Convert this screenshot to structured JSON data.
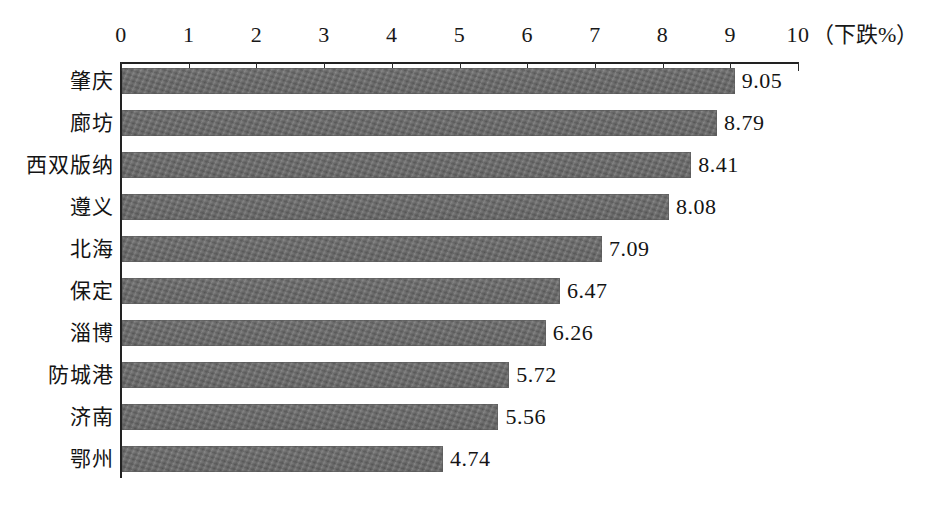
{
  "chart_data": {
    "type": "bar",
    "orientation": "horizontal",
    "title": "",
    "subtitle": "",
    "xlabel": "（下跌%）",
    "ylabel": "",
    "xlim": [
      0,
      10
    ],
    "xticks": [
      "0",
      "1",
      "2",
      "3",
      "4",
      "5",
      "6",
      "7",
      "8",
      "9",
      "10"
    ],
    "grid": false,
    "legend": null,
    "categories": [
      "肇庆",
      "廊坊",
      "西双版纳",
      "遵义",
      "北海",
      "保定",
      "淄博",
      "防城港",
      "济南",
      "鄂州"
    ],
    "values": [
      9.05,
      8.79,
      8.41,
      8.08,
      7.09,
      6.47,
      6.26,
      5.72,
      5.56,
      4.74
    ],
    "value_labels": [
      "9.05",
      "8.79",
      "8.41",
      "8.08",
      "7.09",
      "6.47",
      "6.26",
      "5.72",
      "5.56",
      "4.74"
    ],
    "bar_color": "#6d6d6d",
    "axis_color": "#222222",
    "background": "#ffffff"
  }
}
